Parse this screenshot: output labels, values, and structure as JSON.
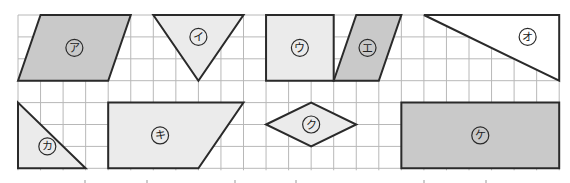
{
  "grid": {
    "origin_x": 18,
    "origin_y": 15,
    "cell_w": 22.55,
    "cell_h": 21.9,
    "cols": 24,
    "rows": 7,
    "line_color": "#b8b8b8"
  },
  "colors": {
    "dark_fill": "#c9c9c9",
    "light_fill": "#ebebeb",
    "white_fill": "#ffffff",
    "stroke": "#2a2a2a"
  },
  "shapes": [
    {
      "id": "a",
      "label": "ア",
      "kind": "parallelogram",
      "fill": "dark",
      "points": [
        [
          0,
          3
        ],
        [
          1,
          0
        ],
        [
          5,
          0
        ],
        [
          4,
          3
        ]
      ],
      "label_at": [
        2.5,
        1.5
      ]
    },
    {
      "id": "i",
      "label": "イ",
      "kind": "triangle",
      "fill": "light",
      "points": [
        [
          6,
          0
        ],
        [
          10,
          0
        ],
        [
          8,
          3
        ]
      ],
      "label_at": [
        8,
        1
      ]
    },
    {
      "id": "u",
      "label": "ウ",
      "kind": "square",
      "fill": "light",
      "points": [
        [
          11,
          0
        ],
        [
          14,
          0
        ],
        [
          14,
          3
        ],
        [
          11,
          3
        ]
      ],
      "label_at": [
        12.5,
        1.5
      ]
    },
    {
      "id": "e",
      "label": "エ",
      "kind": "parallelogram",
      "fill": "dark",
      "points": [
        [
          14,
          3
        ],
        [
          15,
          0
        ],
        [
          17,
          0
        ],
        [
          16,
          3
        ]
      ],
      "label_at": [
        15.5,
        1.5
      ]
    },
    {
      "id": "o",
      "label": "オ",
      "kind": "triangle",
      "fill": "white",
      "points": [
        [
          18,
          0
        ],
        [
          24,
          0
        ],
        [
          24,
          3
        ]
      ],
      "label_at": [
        22.6,
        1
      ]
    },
    {
      "id": "ka",
      "label": "カ",
      "kind": "triangle",
      "fill": "light",
      "points": [
        [
          0,
          4
        ],
        [
          0,
          7
        ],
        [
          3,
          7
        ]
      ],
      "label_at": [
        1.3,
        6
      ]
    },
    {
      "id": "ki",
      "label": "キ",
      "kind": "trapezoid",
      "fill": "light",
      "points": [
        [
          4,
          4
        ],
        [
          10,
          4
        ],
        [
          8,
          7
        ],
        [
          4,
          7
        ]
      ],
      "label_at": [
        6.3,
        5.5
      ]
    },
    {
      "id": "ku",
      "label": "ク",
      "kind": "rhombus",
      "fill": "light",
      "points": [
        [
          11,
          5
        ],
        [
          13,
          4
        ],
        [
          15,
          5
        ],
        [
          13,
          6
        ]
      ],
      "label_at": [
        13,
        5
      ]
    },
    {
      "id": "ke",
      "label": "ケ",
      "kind": "rectangle",
      "fill": "dark",
      "points": [
        [
          17,
          4
        ],
        [
          24,
          4
        ],
        [
          24,
          7
        ],
        [
          17,
          7
        ]
      ],
      "label_at": [
        20.5,
        5.5
      ]
    }
  ],
  "ticks_x": [
    85,
    147,
    235,
    296,
    424,
    486
  ]
}
